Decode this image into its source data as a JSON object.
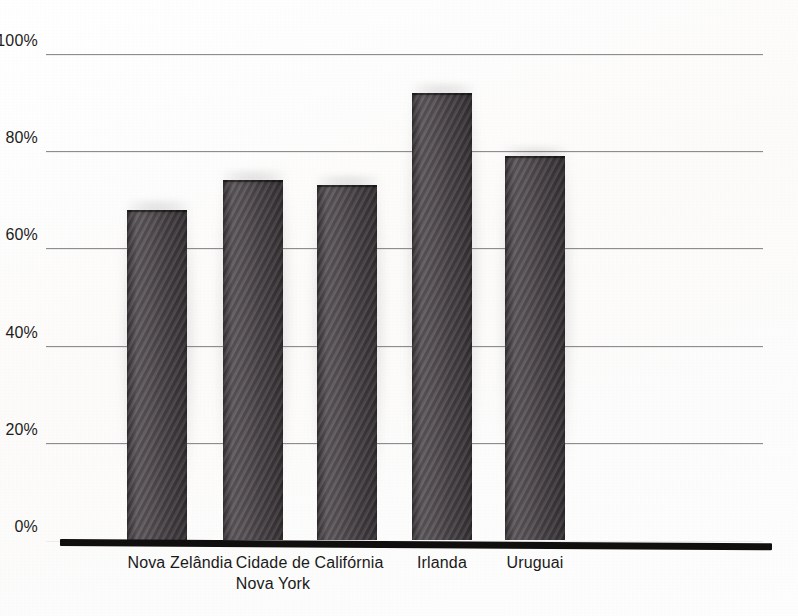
{
  "chart_data": {
    "type": "bar",
    "title": "",
    "subtitle": "",
    "xlabel": "",
    "ylabel": "",
    "categories": [
      "Nova Zelândia",
      "Cidade de\nNova York",
      "Califórnia",
      "Irlanda",
      "Uruguai"
    ],
    "values": [
      68,
      74,
      73,
      92,
      79
    ],
    "ylim": [
      0,
      100
    ],
    "ytick_labels": [
      "0%",
      "20%",
      "40%",
      "60%",
      "80%",
      "100%"
    ],
    "ytick_values": [
      0,
      20,
      40,
      60,
      80,
      100
    ],
    "grid": true,
    "legend": false,
    "legend_position": "none",
    "value_suffix": "%",
    "series": [
      {
        "name": "",
        "values": [
          68,
          74,
          73,
          92,
          79
        ]
      }
    ],
    "colors": {
      "bar_fill": "#4b4549",
      "gridline": "#8d8d8d",
      "axis_line": "#100f0e",
      "label_text": "#1a1a1a",
      "background": "#fdfdfc"
    }
  }
}
